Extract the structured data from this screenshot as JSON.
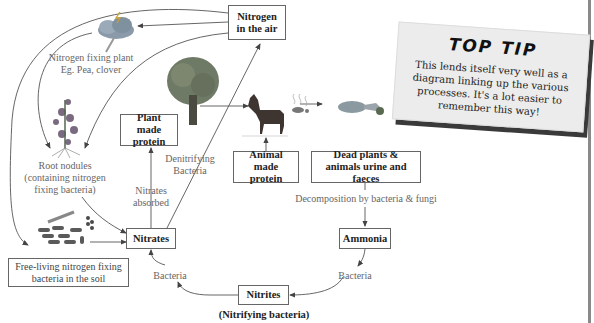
{
  "diagram": {
    "nodes": {
      "nitrogen_air": "Nitrogen in the air",
      "plant_protein": "Plant made protein",
      "animal_protein": "Animal made protein",
      "dead_matter": "Dead plants & animals urine and faeces",
      "ammonia": "Ammonia",
      "nitrites": "Nitrites",
      "nitrates": "Nitrates",
      "free_living": "Free-living nitrogen fixing bacteria in the soil"
    },
    "labels": {
      "fixing_plant_1": "Nitrogen fixing plant",
      "fixing_plant_2": "Eg. Pea, clover",
      "root_1": "Root nodules",
      "root_2": "(containing nitrogen",
      "root_3": "fixing bacteria)",
      "nitrates_absorbed_1": "Nitrates",
      "nitrates_absorbed_2": "absorbed",
      "denitrifying_1": "Denitrifying",
      "denitrifying_2": "Bacteria",
      "decomposition": "Decomposition by bacteria & fungi",
      "bacteria_ammonia": "Bacteria",
      "bacteria_nitrites": "Bacteria",
      "nitrifying": "(Nitrifying bacteria)"
    },
    "illustrations": [
      "lightning-cloud",
      "pea-plant",
      "tree",
      "horse",
      "dung",
      "dead-animal",
      "soil-bacteria"
    ]
  },
  "top_tip": {
    "title": "TOP TIP",
    "body": "This lends itself very well as a diagram linking up the various processes. It's a lot easier to remember this way!"
  },
  "colors": {
    "line": "#555555",
    "box_border": "#666666",
    "label_text": "#666666",
    "tip_bg": "#ececec",
    "tip_shadow": "#3a3a3a"
  }
}
